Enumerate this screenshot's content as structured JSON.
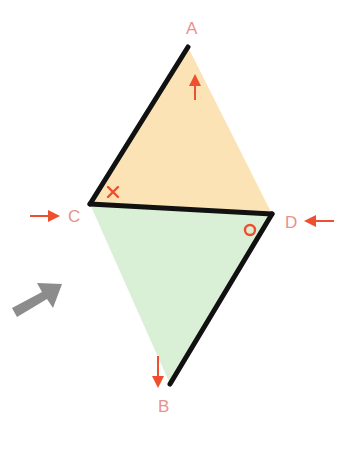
{
  "diagram": {
    "type": "geometry-rhombus-fold",
    "colors": {
      "top_triangle_fill": "#fbe3b6",
      "bottom_triangle_fill": "#d9f0d6",
      "edge": "#111111",
      "label": "#e8928a",
      "arrow_red": "#ee4f2e",
      "arrow_gray": "#8c8c8c"
    },
    "points": {
      "A": {
        "label": "A",
        "x": 188,
        "y": 47
      },
      "B": {
        "label": "B",
        "x": 170,
        "y": 384
      },
      "C": {
        "label": "C",
        "x": 90,
        "y": 204
      },
      "D": {
        "label": "D",
        "x": 272,
        "y": 214
      }
    },
    "triangles": [
      {
        "name": "ACD",
        "fill": "top"
      },
      {
        "name": "BCD",
        "fill": "bottom"
      }
    ],
    "bold_edges": [
      "AC",
      "CD",
      "DB"
    ],
    "angle_marks": [
      {
        "vertex": "C",
        "mark": "×"
      },
      {
        "vertex": "D",
        "mark": "○"
      }
    ],
    "arrows": [
      {
        "at": "A",
        "direction": "up",
        "color": "red"
      },
      {
        "at": "B",
        "direction": "down",
        "color": "red"
      },
      {
        "at": "C",
        "direction": "right",
        "color": "red"
      },
      {
        "at": "D",
        "direction": "left",
        "color": "red"
      },
      {
        "at": "lower-left",
        "direction": "up-right",
        "color": "gray"
      }
    ]
  }
}
